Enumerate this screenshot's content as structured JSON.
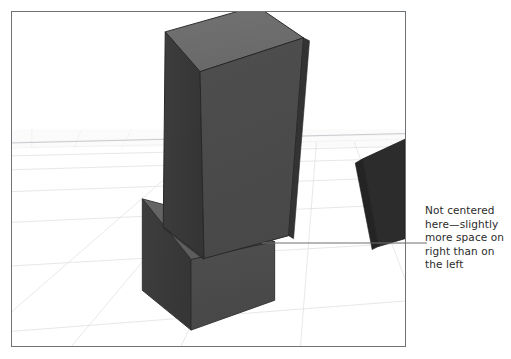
{
  "figure": {
    "domain": "3D modeling viewport screenshot with printed callout annotation",
    "background_color": "#ffffff"
  },
  "viewport": {
    "name": "3d-modeling-viewport",
    "frame_color": "#6e7378",
    "frame_rect": {
      "x": 11,
      "y": 11,
      "width": 395,
      "height": 336
    },
    "background_color": "#ffffff",
    "ground": {
      "name": "perspective-grid-floor",
      "grid_line_color": "#d8d8d8",
      "grid_line_color_faint": "#e8e8e8",
      "horizon_y": 145,
      "horizon_line_color": "#c9c9cf"
    },
    "objects": [
      {
        "name": "main-column",
        "kind": "rectangular-column",
        "top_face_color": "#6d6d6d",
        "front_face_color": "#4b4b4b",
        "side_face_color": "#3a3a3a",
        "edge_color": "#2e2e2e"
      },
      {
        "name": "column-base-pedestal",
        "kind": "rectangular-plinth",
        "top_face_color": "#636363",
        "front_face_color": "#4b4b4b",
        "side_face_color": "#3b3b3b",
        "edge_color": "#2e2e2e"
      },
      {
        "name": "background-column",
        "kind": "rectangular-column",
        "front_face_color": "#2f2f2f",
        "side_face_color": "#252525",
        "edge_color": "#1f1f1f"
      }
    ]
  },
  "annotation": {
    "name": "callout-not-centered",
    "text_color": "#2b2b2b",
    "leader_line_color": "#6e6e6e",
    "lines": [
      "Not centered",
      "here—slightly",
      "more space on",
      "right than on",
      "the left"
    ],
    "full_text": "Not centered here—slightly more space on right than on the left",
    "leader": {
      "from": {
        "x": 262,
        "y": 243
      },
      "to": {
        "x": 424,
        "y": 243
      }
    }
  }
}
